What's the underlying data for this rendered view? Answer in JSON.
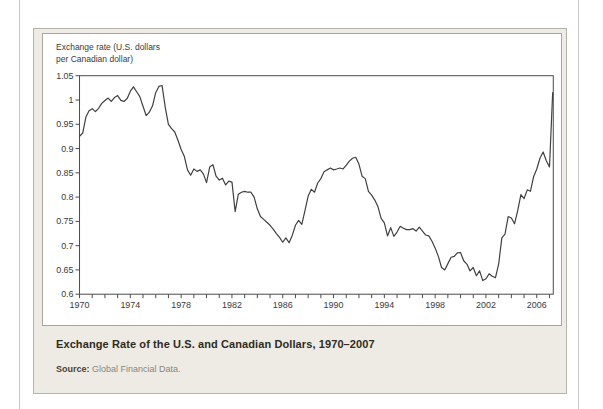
{
  "figure": {
    "axis_label_line1": "Exchange rate (U.S. dollars",
    "axis_label_line2": "per Canadian dollar)",
    "caption_title": "Exchange Rate of the U.S. and Canadian Dollars, 1970–2007",
    "source_label": "Source:",
    "source_text": " Global Financial Data."
  },
  "chart_data": {
    "type": "line",
    "title": "Exchange Rate of the U.S. and Canadian Dollars, 1970–2007",
    "ylabel": "Exchange rate (U.S. dollars per Canadian dollar)",
    "xlabel": "",
    "xlim": [
      1970,
      2007.3
    ],
    "ylim": [
      0.6,
      1.05
    ],
    "grid": false,
    "legend": false,
    "y_ticks": [
      0.6,
      0.65,
      0.7,
      0.75,
      0.8,
      0.85,
      0.9,
      0.95,
      1.0,
      1.05
    ],
    "y_tick_labels": [
      "0.6",
      "0.65",
      "0.7",
      "0.75",
      "0.8",
      "0.85",
      "0.9",
      "0.95",
      "1",
      "1.05"
    ],
    "x_major_ticks": [
      1970,
      1974,
      1978,
      1982,
      1986,
      1990,
      1994,
      1998,
      2002,
      2006
    ],
    "x_minor_tick_interval_years": 1,
    "line_color": "#3f3f3f",
    "series": [
      {
        "name": "Exchange rate (U.S. dollars per Canadian dollar)",
        "x_start": 1970,
        "x_step_years": 0.25,
        "values": [
          0.925,
          0.932,
          0.965,
          0.978,
          0.982,
          0.976,
          0.983,
          0.993,
          0.999,
          1.004,
          0.997,
          1.005,
          1.009,
          0.999,
          0.997,
          1.003,
          1.018,
          1.027,
          1.017,
          1.007,
          0.987,
          0.968,
          0.975,
          0.988,
          1.015,
          1.028,
          1.03,
          0.985,
          0.95,
          0.941,
          0.934,
          0.917,
          0.898,
          0.884,
          0.856,
          0.845,
          0.858,
          0.853,
          0.856,
          0.848,
          0.83,
          0.862,
          0.867,
          0.843,
          0.835,
          0.839,
          0.825,
          0.833,
          0.831,
          0.77,
          0.806,
          0.81,
          0.812,
          0.81,
          0.81,
          0.8,
          0.776,
          0.76,
          0.754,
          0.748,
          0.742,
          0.734,
          0.725,
          0.717,
          0.707,
          0.716,
          0.706,
          0.721,
          0.742,
          0.752,
          0.744,
          0.772,
          0.802,
          0.816,
          0.81,
          0.829,
          0.838,
          0.852,
          0.856,
          0.86,
          0.856,
          0.858,
          0.86,
          0.858,
          0.866,
          0.874,
          0.88,
          0.882,
          0.868,
          0.843,
          0.838,
          0.812,
          0.804,
          0.794,
          0.78,
          0.756,
          0.747,
          0.72,
          0.737,
          0.719,
          0.728,
          0.74,
          0.736,
          0.733,
          0.733,
          0.735,
          0.73,
          0.738,
          0.73,
          0.722,
          0.72,
          0.709,
          0.695,
          0.678,
          0.655,
          0.65,
          0.663,
          0.676,
          0.678,
          0.685,
          0.686,
          0.669,
          0.662,
          0.648,
          0.655,
          0.638,
          0.648,
          0.628,
          0.632,
          0.642,
          0.637,
          0.634,
          0.662,
          0.716,
          0.724,
          0.76,
          0.757,
          0.745,
          0.772,
          0.805,
          0.797,
          0.815,
          0.812,
          0.842,
          0.858,
          0.88,
          0.893,
          0.875,
          0.862,
          1.015
        ]
      }
    ]
  }
}
